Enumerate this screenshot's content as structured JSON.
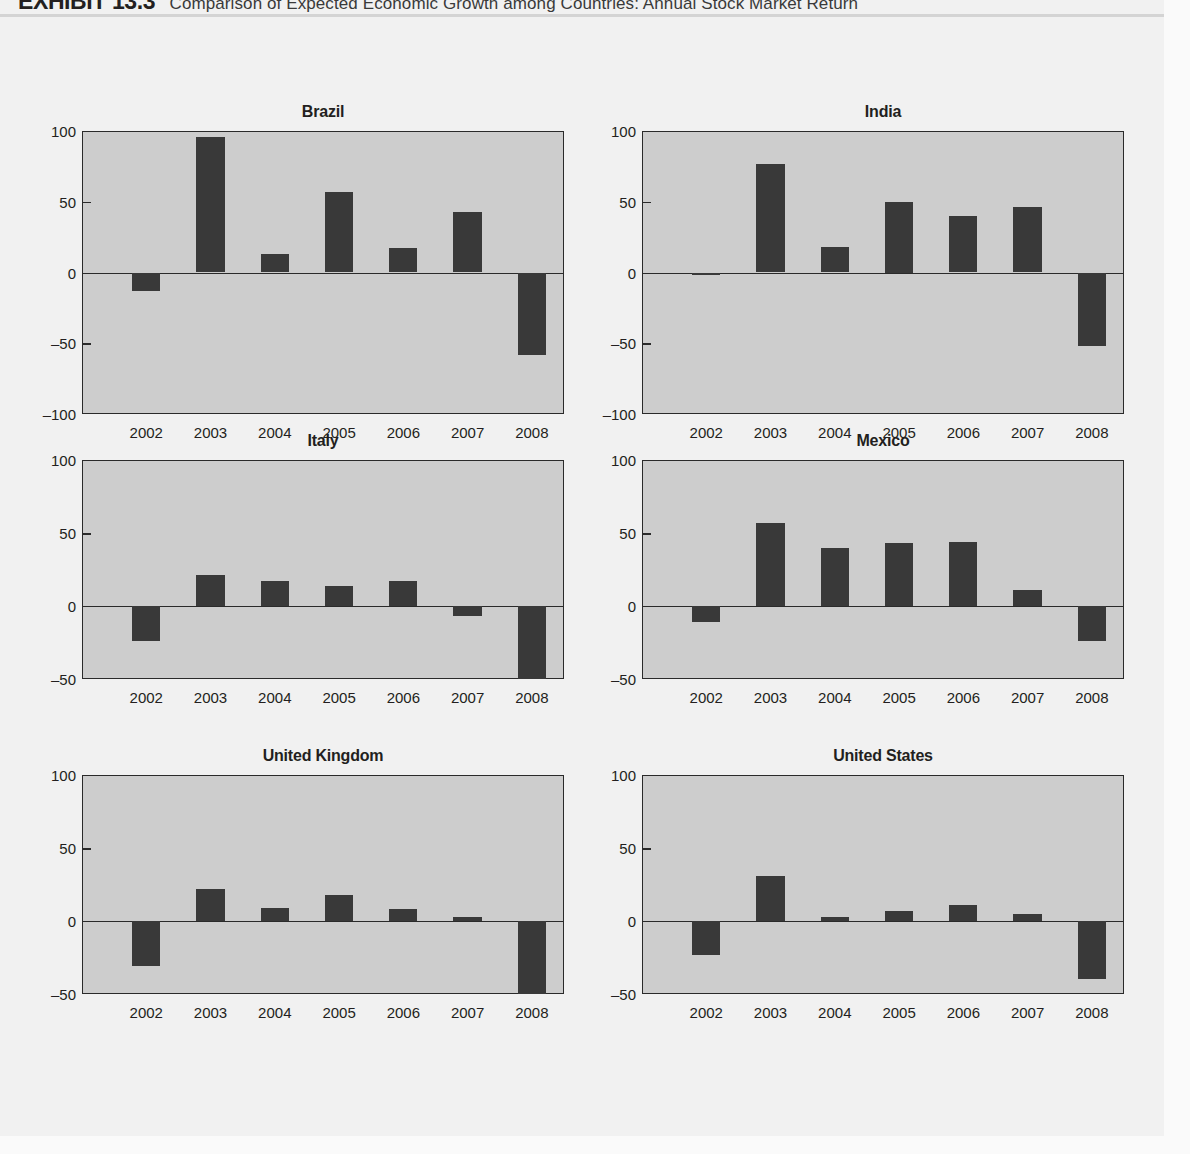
{
  "header": {
    "exhibit_label": "EXHIBIT 13.3",
    "title": "Comparison of Expected Economic Growth among Countries: Annual Stock Market Return"
  },
  "colors": {
    "page_background": "#f1f1f1",
    "plot_background": "#cdcdcd",
    "bar": "#393939",
    "axis": "#2a2a2a",
    "text": "#231f20"
  },
  "chart_data": [
    {
      "type": "bar",
      "title": "Brazil",
      "xlabel": "",
      "ylabel": "",
      "categories": [
        "2002",
        "2003",
        "2004",
        "2005",
        "2006",
        "2007",
        "2008"
      ],
      "values": [
        -13,
        96,
        13,
        57,
        17,
        43,
        -58
      ],
      "ylim": [
        -100,
        100
      ],
      "yticks": [
        100,
        50,
        0,
        -50,
        -100
      ],
      "ytick_labels": [
        "100",
        "50",
        "0",
        "-50",
        "-100"
      ],
      "grid": false,
      "legend": "none"
    },
    {
      "type": "bar",
      "title": "India",
      "xlabel": "",
      "ylabel": "",
      "categories": [
        "2002",
        "2003",
        "2004",
        "2005",
        "2006",
        "2007",
        "2008"
      ],
      "values": [
        -2,
        77,
        18,
        50,
        40,
        46,
        -52
      ],
      "ylim": [
        -100,
        100
      ],
      "yticks": [
        100,
        50,
        0,
        -50,
        -100
      ],
      "ytick_labels": [
        "100",
        "50",
        "0",
        "-50",
        "-100"
      ],
      "grid": false,
      "legend": "none"
    },
    {
      "type": "bar",
      "title": "Italy",
      "xlabel": "",
      "ylabel": "",
      "categories": [
        "2002",
        "2003",
        "2004",
        "2005",
        "2006",
        "2007",
        "2008"
      ],
      "values": [
        -24,
        21,
        17,
        14,
        17,
        -7,
        -50
      ],
      "ylim": [
        -50,
        100
      ],
      "yticks": [
        100,
        50,
        0,
        -50
      ],
      "ytick_labels": [
        "100",
        "50",
        "0",
        "-50"
      ],
      "grid": false,
      "legend": "none"
    },
    {
      "type": "bar",
      "title": "Mexico",
      "xlabel": "",
      "ylabel": "",
      "categories": [
        "2002",
        "2003",
        "2004",
        "2005",
        "2006",
        "2007",
        "2008"
      ],
      "values": [
        -11,
        57,
        40,
        43,
        44,
        11,
        -24
      ],
      "ylim": [
        -50,
        100
      ],
      "yticks": [
        100,
        50,
        0,
        -50
      ],
      "ytick_labels": [
        "100",
        "50",
        "0",
        "-50"
      ],
      "grid": false,
      "legend": "none"
    },
    {
      "type": "bar",
      "title": "United Kingdom",
      "xlabel": "",
      "ylabel": "",
      "categories": [
        "2002",
        "2003",
        "2004",
        "2005",
        "2006",
        "2007",
        "2008"
      ],
      "values": [
        -31,
        22,
        9,
        18,
        8,
        3,
        -50
      ],
      "ylim": [
        -50,
        100
      ],
      "yticks": [
        100,
        50,
        0,
        -50
      ],
      "ytick_labels": [
        "100",
        "50",
        "0",
        "-50"
      ],
      "grid": false,
      "legend": "none"
    },
    {
      "type": "bar",
      "title": "United States",
      "xlabel": "",
      "ylabel": "",
      "categories": [
        "2002",
        "2003",
        "2004",
        "2005",
        "2006",
        "2007",
        "2008"
      ],
      "values": [
        -23,
        31,
        3,
        7,
        11,
        5,
        -40
      ],
      "ylim": [
        -50,
        100
      ],
      "yticks": [
        100,
        50,
        0,
        -50
      ],
      "ytick_labels": [
        "100",
        "50",
        "0",
        "-50"
      ],
      "grid": false,
      "legend": "none"
    }
  ],
  "layout": {
    "panels": [
      {
        "left": 38,
        "top": 86,
        "width": 530,
        "plot_left": 44,
        "plot_top": 28,
        "plot_width": 482,
        "plot_height": 283
      },
      {
        "left": 598,
        "top": 86,
        "width": 530,
        "plot_left": 44,
        "plot_top": 28,
        "plot_width": 482,
        "plot_height": 283
      },
      {
        "left": 38,
        "top": 415,
        "width": 530,
        "plot_left": 44,
        "plot_top": 28,
        "plot_width": 482,
        "plot_height": 219
      },
      {
        "left": 598,
        "top": 415,
        "width": 530,
        "plot_left": 44,
        "plot_top": 28,
        "plot_width": 482,
        "plot_height": 219
      },
      {
        "left": 38,
        "top": 730,
        "width": 530,
        "plot_left": 44,
        "plot_top": 28,
        "plot_width": 482,
        "plot_height": 219
      },
      {
        "left": 598,
        "top": 730,
        "width": 530,
        "plot_left": 44,
        "plot_top": 28,
        "plot_width": 482,
        "plot_height": 219
      }
    ],
    "bar_width_ratio": 0.44,
    "slot_count": 7.5
  }
}
